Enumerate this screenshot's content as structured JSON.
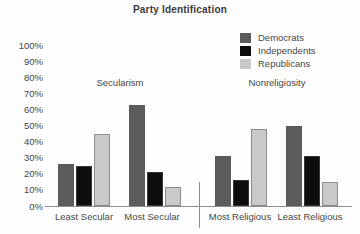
{
  "title": "Party Identification",
  "legend": {
    "items": [
      {
        "label": "Democrats",
        "color": "#5c5c5c"
      },
      {
        "label": "Independents",
        "color": "#0d0d0d"
      },
      {
        "label": "Republicans",
        "color": "#c9c9c9"
      }
    ]
  },
  "chart_data": {
    "type": "bar",
    "title": "Party Identification",
    "categories": [
      "Least Secular",
      "Most Secular",
      "Most Religious",
      "Least Religious"
    ],
    "series": [
      {
        "name": "Democrats",
        "color": "#5c5c5c",
        "values": [
          26,
          63,
          31,
          50
        ]
      },
      {
        "name": "Independents",
        "color": "#0d0d0d",
        "values": [
          25,
          21,
          16,
          31
        ]
      },
      {
        "name": "Republicans",
        "color": "#c9c9c9",
        "values": [
          45,
          12,
          48,
          15
        ]
      }
    ],
    "sections": [
      {
        "label": "Secularism",
        "categories": [
          "Least Secular",
          "Most Secular"
        ]
      },
      {
        "label": "Nonreligiosity",
        "categories": [
          "Most Religious",
          "Least Religious"
        ]
      }
    ],
    "ylim": [
      0,
      100
    ],
    "yticks": [
      "100%",
      "90%",
      "80%",
      "70%",
      "60%",
      "50%",
      "40%",
      "30%",
      "20%",
      "10%",
      "0%"
    ],
    "xlabel": "",
    "ylabel": "",
    "grid": false,
    "legend_position": "top-right"
  }
}
